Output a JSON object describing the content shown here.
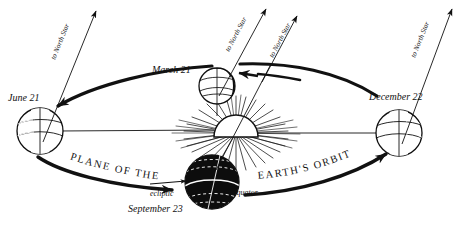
{
  "figure": {
    "kind": "astronomy-diagram",
    "background_color": "#ffffff",
    "ink_color": "#111111",
    "shadow_color": "#0d0d0d"
  },
  "orbit": {
    "plane_label_left": "PLANE OF THE",
    "plane_label_right": "EARTH'S ORBIT",
    "direction": "counterclockwise as drawn",
    "ellipse": {
      "center_x": 236,
      "center_y": 124,
      "radius_x": 196,
      "radius_y": 50
    }
  },
  "sun": {
    "name": "sun",
    "center_x": 236,
    "center_y": 133,
    "radius": 22,
    "ray_count": 44,
    "shape": "dome"
  },
  "ecliptic": {
    "label": "ecliptic",
    "line_label": "horizontal ecliptic plane line"
  },
  "equator": {
    "label": "equator"
  },
  "axis_label": "to North Star",
  "earths": [
    {
      "id": "june",
      "date_label": "June 21",
      "axis_label": "to North Star",
      "center_x": 40,
      "center_y": 131,
      "radius": 23,
      "shadow_side": "left",
      "date_x": 8,
      "date_y": 101
    },
    {
      "id": "march",
      "date_label": "March 21",
      "axis_label": "to North Star",
      "center_x": 217,
      "center_y": 86,
      "radius": 18,
      "shadow_side": "right",
      "date_x": 152,
      "date_y": 73
    },
    {
      "id": "september",
      "date_label": "September 23",
      "axis_label": "to North Star",
      "center_x": 212,
      "center_y": 182,
      "radius": 27,
      "shadow_side": "full",
      "date_x": 128,
      "date_y": 212
    },
    {
      "id": "december",
      "date_label": "December 22",
      "axis_label": "to North Star",
      "center_x": 399,
      "center_y": 133,
      "radius": 23,
      "shadow_side": "right",
      "date_x": 369,
      "date_y": 100
    }
  ]
}
